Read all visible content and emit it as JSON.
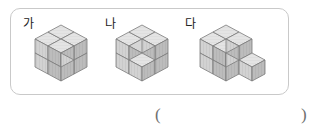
{
  "page": {
    "kind": "math-worksheet-figure",
    "background_color": "#ffffff"
  },
  "figure_panel": {
    "border_color": "#c9c9c9",
    "figures": [
      {
        "label": "가",
        "shape_name": "l-shape-two-layer-six-cubes",
        "cube_count": 6,
        "layers": 2,
        "footprint": "L-shape of 3 unit squares",
        "cells": [
          {
            "x": 0,
            "y": 0,
            "z": 0
          },
          {
            "x": 0,
            "y": 1,
            "z": 0
          },
          {
            "x": 1,
            "y": 1,
            "z": 0
          },
          {
            "x": 0,
            "y": 0,
            "z": 1
          },
          {
            "x": 0,
            "y": 1,
            "z": 1
          },
          {
            "x": 1,
            "y": 1,
            "z": 1
          }
        ]
      },
      {
        "label": "나",
        "shape_name": "two-by-two-by-two-with-notch",
        "cube_count": 7,
        "layers": 2,
        "footprint": "2 by 2 square",
        "cells": [
          {
            "x": 0,
            "y": 0,
            "z": 0
          },
          {
            "x": 1,
            "y": 0,
            "z": 0
          },
          {
            "x": 0,
            "y": 1,
            "z": 0
          },
          {
            "x": 1,
            "y": 1,
            "z": 0
          },
          {
            "x": 0,
            "y": 0,
            "z": 1
          },
          {
            "x": 1,
            "y": 0,
            "z": 1
          },
          {
            "x": 0,
            "y": 1,
            "z": 1
          }
        ]
      },
      {
        "label": "다",
        "shape_name": "l-shape-two-layer-with-single-side-cube",
        "cube_count": 7,
        "layers": 2,
        "footprint": "L-shape of 3 unit squares plus 1 attached cube",
        "cells": [
          {
            "x": 0,
            "y": 0,
            "z": 0
          },
          {
            "x": 0,
            "y": 1,
            "z": 0
          },
          {
            "x": 1,
            "y": 1,
            "z": 0
          },
          {
            "x": 2,
            "y": 1,
            "z": 0
          },
          {
            "x": 0,
            "y": 0,
            "z": 1
          },
          {
            "x": 0,
            "y": 1,
            "z": 1
          },
          {
            "x": 1,
            "y": 1,
            "z": 1
          }
        ]
      }
    ]
  },
  "answer_row": {
    "paren_open": "(",
    "paren_close": ")",
    "answer_value": ""
  },
  "colors": {
    "cube_top": "#e3e3e3",
    "cube_left": "#d2d2d2",
    "cube_right": "#b9b9b9",
    "cube_stroke": "#7a7a7a",
    "panel_border": "#c9c9c9",
    "text": "#222222",
    "paren": "#6f6f6f"
  }
}
